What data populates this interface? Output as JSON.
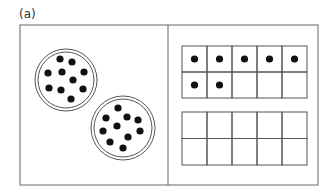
{
  "figure": {
    "label": "(a)",
    "colors": {
      "line": "#555555",
      "dot": "#111111",
      "background": "#ffffff"
    }
  },
  "left_panel": {
    "description": "Two plates, each with 10 counters",
    "plates": [
      {
        "name": "plate-1",
        "cx": 66,
        "cy": 80,
        "r_outer": 31,
        "r_inner": 28,
        "dot_count": 10,
        "dots": [
          [
            60,
            59
          ],
          [
            72,
            62
          ],
          [
            48,
            73
          ],
          [
            62,
            72
          ],
          [
            84,
            72
          ],
          [
            73,
            80
          ],
          [
            49,
            88
          ],
          [
            61,
            90
          ],
          [
            83,
            89
          ],
          [
            71,
            99
          ]
        ]
      },
      {
        "name": "plate-2",
        "cx": 123,
        "cy": 128,
        "r_outer": 32,
        "r_inner": 29,
        "dot_count": 10,
        "dots": [
          [
            118,
            108
          ],
          [
            106,
            118
          ],
          [
            127,
            117
          ],
          [
            138,
            120
          ],
          [
            117,
            126
          ],
          [
            103,
            131
          ],
          [
            140,
            131
          ],
          [
            128,
            137
          ],
          [
            110,
            142
          ],
          [
            123,
            148
          ]
        ]
      }
    ]
  },
  "right_panel": {
    "description": "Two ten-frames",
    "ten_frames": [
      {
        "name": "ten-frame-top",
        "x": 182,
        "y": 46,
        "cols": 5,
        "rows": 2,
        "cell_w": 25,
        "cell_h": 26,
        "filled_count": 7,
        "filled": [
          [
            0,
            0
          ],
          [
            0,
            1
          ],
          [
            0,
            2
          ],
          [
            0,
            3
          ],
          [
            0,
            4
          ],
          [
            1,
            0
          ],
          [
            1,
            1
          ]
        ]
      },
      {
        "name": "ten-frame-bottom",
        "x": 182,
        "y": 112,
        "cols": 5,
        "rows": 2,
        "cell_w": 25,
        "cell_h": 26.5,
        "filled_count": 0,
        "filled": []
      }
    ]
  }
}
